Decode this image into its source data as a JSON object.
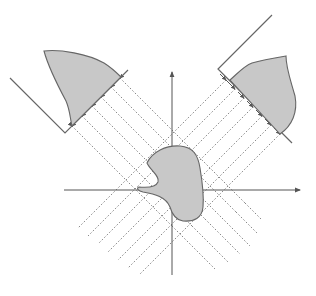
{
  "diagram": {
    "title": "",
    "colors": {
      "background": "#ffffff",
      "object_fill": "#c8c8c8",
      "outline": "#666666",
      "ray": "#7a7a7a",
      "axis": "#555555"
    },
    "elements": {
      "object": {
        "label": "",
        "shape": "irregular blob at origin"
      },
      "axes": {
        "x_label": "",
        "y_label": ""
      },
      "left_detector": {
        "label": "",
        "projection": "left projection profile",
        "ray_count": 6
      },
      "right_detector": {
        "label": "",
        "projection": "right projection profile",
        "ray_count": 7
      },
      "rays": {
        "style": "dotted",
        "direction_left": "45deg down-right",
        "direction_right": "45deg down-left"
      }
    }
  }
}
